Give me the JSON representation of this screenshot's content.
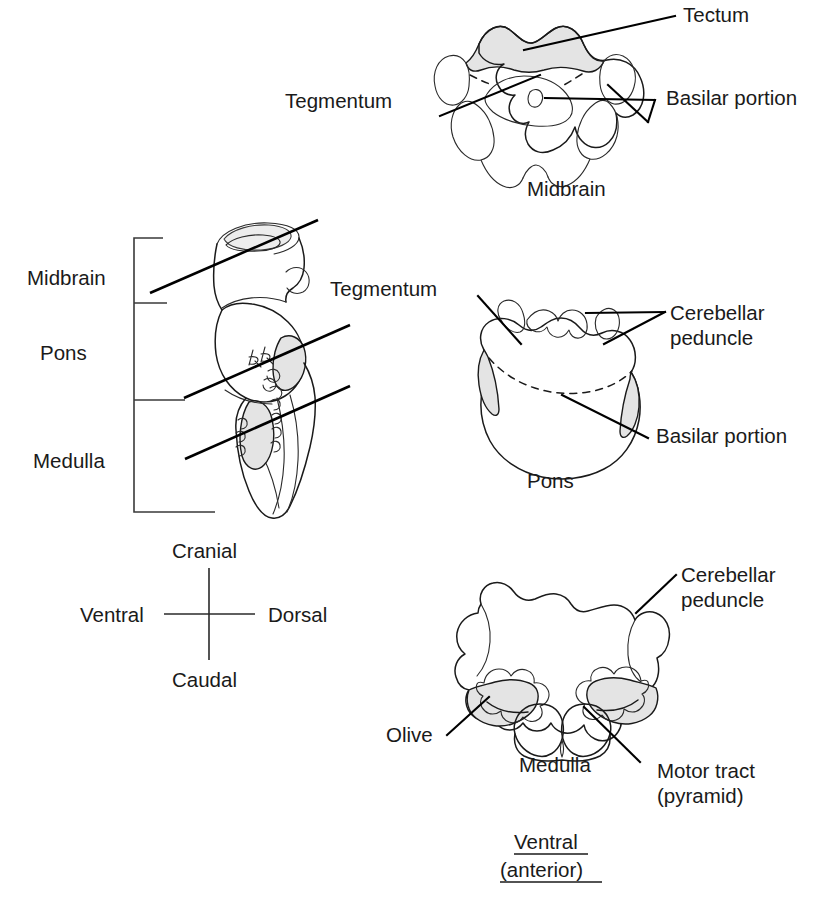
{
  "figure": {
    "orientation_note": "Ventral (anterior) view"
  },
  "panels": {
    "midbrain_section": {
      "caption": "Midbrain",
      "labels": {
        "tectum": "Tectum",
        "tegmentum": "Tegmentum",
        "basilar_portion": "Basilar portion"
      }
    },
    "sagittal": {
      "labels": {
        "midbrain": "Midbrain",
        "pons": "Pons",
        "medulla": "Medulla",
        "tegmentum": "Tegmentum"
      }
    },
    "pons_section": {
      "caption": "Pons",
      "labels": {
        "cerebellar_peduncle_line1": "Cerebellar",
        "cerebellar_peduncle_line2": "peduncle",
        "basilar_portion": "Basilar portion"
      }
    },
    "medulla_section": {
      "caption": "Medulla",
      "labels": {
        "cerebellar_peduncle_line1": "Cerebellar",
        "cerebellar_peduncle_line2": "peduncle",
        "olive": "Olive",
        "motor_tract_line1": "Motor tract",
        "motor_tract_line2": "(pyramid)"
      },
      "view_label_line1": "Ventral",
      "view_label_line2": "(anterior)"
    },
    "orientation_compass": {
      "cranial": "Cranial",
      "caudal": "Caudal",
      "ventral": "Ventral",
      "dorsal": "Dorsal"
    }
  },
  "colors": {
    "ink": "#1a1a1a",
    "shading": "#e4e4e4",
    "background": "#ffffff"
  }
}
